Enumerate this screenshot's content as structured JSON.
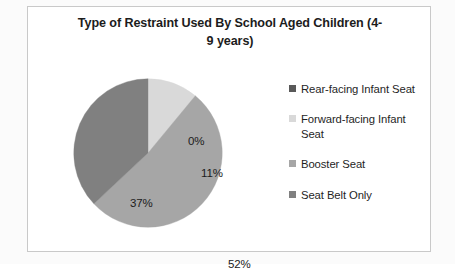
{
  "chart_data": {
    "type": "pie",
    "title_line1": "Type of Restraint Used By School Aged Children (4-",
    "title_line2": "9 years)",
    "xlabel": "",
    "ylabel": "",
    "legend_position": "right",
    "grid": false,
    "categories": [
      "Rear-facing Infant Seat",
      "Forward-facing Infant Seat",
      "Booster Seat",
      "Seat Belt Only"
    ],
    "values": [
      0,
      11,
      52,
      37
    ],
    "data_labels": [
      "0%",
      "11%",
      "52%",
      "37%"
    ],
    "units": "percent",
    "start_angle_deg": 0,
    "direction": "clockwise",
    "colors": [
      "#595959",
      "#d9d9d9",
      "#a6a6a6",
      "#808080"
    ],
    "slices": [
      {
        "label": "Rear-facing Infant Seat",
        "value": 0,
        "data_label": "0%",
        "color": "#595959"
      },
      {
        "label": "Forward-facing Infant Seat",
        "value": 11,
        "data_label": "11%",
        "color": "#d9d9d9"
      },
      {
        "label": "Booster Seat",
        "value": 52,
        "data_label": "52%",
        "color": "#a6a6a6"
      },
      {
        "label": "Seat Belt Only",
        "value": 37,
        "data_label": "37%",
        "color": "#808080"
      }
    ]
  },
  "legend": {
    "items": [
      {
        "label": "Rear-facing Infant Seat",
        "color": "#595959"
      },
      {
        "label": "Forward-facing Infant Seat",
        "color": "#d9d9d9"
      },
      {
        "label": "Booster Seat",
        "color": "#a6a6a6"
      },
      {
        "label": "Seat Belt Only",
        "color": "#808080"
      }
    ]
  },
  "style": {
    "frame_color": "#c9c9c9",
    "background": "#ffffff",
    "text_color": "#1c1c1c"
  }
}
